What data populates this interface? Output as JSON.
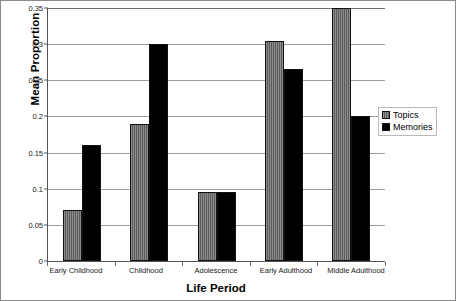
{
  "chart_data": {
    "type": "bar",
    "title": "",
    "xlabel": "Life Period",
    "ylabel": "Mean Proportion",
    "categories": [
      "Early Childhood",
      "Childhood",
      "Adolescence",
      "Early Adulthood",
      "Middle Adulthood"
    ],
    "series": [
      {
        "name": "Topics",
        "color": "#5b5b5b",
        "values": [
          0.07,
          0.19,
          0.095,
          0.305,
          0.35
        ]
      },
      {
        "name": "Memories",
        "color": "#000000",
        "values": [
          0.16,
          0.3,
          0.095,
          0.265,
          0.2
        ]
      }
    ],
    "ylim": [
      0,
      0.35
    ],
    "ytick_values": [
      0,
      0.05,
      0.1,
      0.15,
      0.2,
      0.25,
      0.3,
      0.35
    ],
    "ytick_labels": [
      "0",
      "0.05",
      "0.1",
      "0.15",
      "0.2",
      "0.25",
      "0.3",
      "0.35"
    ],
    "grid": true,
    "grid_axis": "y",
    "legend_position": "right",
    "legend": [
      "Topics",
      "Memories"
    ]
  }
}
